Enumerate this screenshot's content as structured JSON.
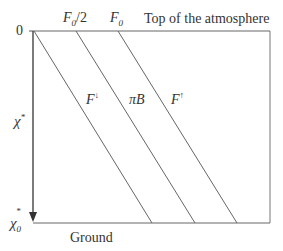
{
  "diagram": {
    "top_label": "Top of the atmosphere",
    "bottom_label": "Ground",
    "axis": {
      "zero_label": "0",
      "mid_label": "χ",
      "mid_sup": "*",
      "bottom_label": "χ",
      "bottom_sub": "0",
      "bottom_sup": "*"
    },
    "top_ticks": [
      {
        "main": "F",
        "sub": "0",
        "suffix": "/2"
      },
      {
        "main": "F",
        "sub": "0",
        "suffix": ""
      }
    ],
    "lines": [
      {
        "main": "F",
        "sup": "↓"
      },
      {
        "main": "πB",
        "sup": ""
      },
      {
        "main": "F",
        "sup": "↑"
      }
    ],
    "colors": {
      "line": "#555555",
      "text": "#333333"
    }
  }
}
